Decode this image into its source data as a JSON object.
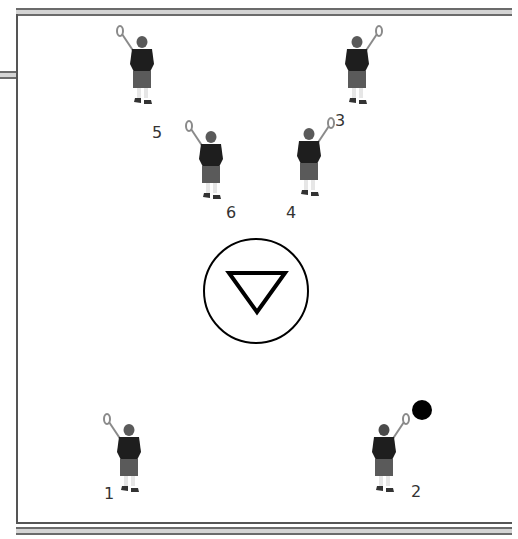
{
  "diagram": {
    "colors": {
      "jersey": "#1e1e1e",
      "shorts": "#5a5a5a",
      "helmet": "#4a4a4a",
      "stick": "#8a8a8a",
      "ball": "#000000",
      "line": "#555555"
    },
    "goal": {
      "symbol": "inverted-triangle-in-circle",
      "cx": 256,
      "cy": 291,
      "r": 52
    },
    "ball": {
      "cx": 422,
      "cy": 410,
      "r": 10
    },
    "players": [
      {
        "number": "1",
        "x": 129,
        "y": 428,
        "label_x": 104,
        "label_y": 486,
        "facing": "front",
        "stick_side": "left"
      },
      {
        "number": "2",
        "x": 384,
        "y": 428,
        "label_x": 411,
        "label_y": 484,
        "facing": "back",
        "stick_side": "right"
      },
      {
        "number": "3",
        "x": 357,
        "y": 40,
        "label_x": 335,
        "label_y": 113,
        "facing": "front",
        "stick_side": "right"
      },
      {
        "number": "4",
        "x": 309,
        "y": 132,
        "label_x": 286,
        "label_y": 205,
        "facing": "front",
        "stick_side": "right"
      },
      {
        "number": "5",
        "x": 142,
        "y": 40,
        "label_x": 152,
        "label_y": 125,
        "facing": "front",
        "stick_side": "left"
      },
      {
        "number": "6",
        "x": 211,
        "y": 135,
        "label_x": 226,
        "label_y": 205,
        "facing": "front",
        "stick_side": "left"
      }
    ]
  }
}
